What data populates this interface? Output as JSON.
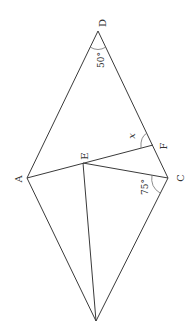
{
  "diagram": {
    "points": {
      "D": {
        "label": "D",
        "x": 98,
        "y": 31
      },
      "A": {
        "label": "A",
        "x": 27,
        "y": 178
      },
      "C": {
        "label": "C",
        "x": 168,
        "y": 178
      },
      "B": {
        "label": "",
        "x": 96,
        "y": 321
      },
      "E": {
        "label": "E",
        "x": 83,
        "y": 163
      },
      "F": {
        "label": "F",
        "x": 153,
        "y": 145
      }
    },
    "angles": {
      "angle_D": "50°",
      "angle_F": "x",
      "angle_C": "75°"
    },
    "colors": {
      "line": "#3a3a3a",
      "text": "#333333",
      "background": "#ffffff"
    }
  }
}
